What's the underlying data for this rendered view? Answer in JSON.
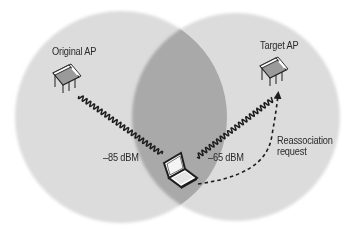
{
  "diagram": {
    "colors": {
      "background": "#ffffff",
      "coverage_circle": "#dcdcdc",
      "overlap_region": "#a9a9a9",
      "line": "#1e1e1e",
      "text": "#2a2a2a"
    },
    "coverage_areas": [
      {
        "name": "original-ap-coverage",
        "cx": 121,
        "cy": 117,
        "r": 106
      },
      {
        "name": "target-ap-coverage",
        "cx": 236,
        "cy": 117,
        "r": 104
      }
    ],
    "nodes": {
      "original_ap": {
        "label": "Original AP",
        "icon": "access-point-icon"
      },
      "target_ap": {
        "label": "Target AP",
        "icon": "access-point-icon"
      },
      "client": {
        "icon": "laptop-icon"
      }
    },
    "links": {
      "to_original": {
        "label": "–85 dBM",
        "style": "wavy-radio-signal"
      },
      "to_target": {
        "label": "–65 dBM",
        "style": "wavy-radio-signal"
      },
      "reassociation": {
        "label": "Reassociation\nrequest",
        "style": "dashed-arrow"
      }
    }
  }
}
